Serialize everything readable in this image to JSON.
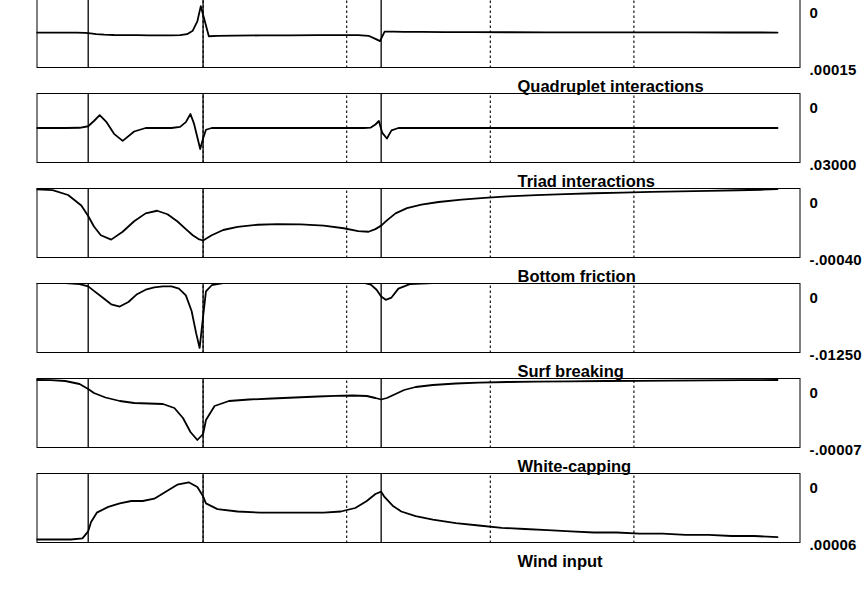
{
  "figure": {
    "source_tag": "WAVEC",
    "x_axis": {
      "title": "",
      "ticks": [
        0,
        250,
        500,
        750,
        1000,
        1250
      ],
      "range": [
        -40,
        1290
      ],
      "gridlines_dotted": [
        250,
        500,
        750,
        1000
      ]
    },
    "pole_markers": [
      {
        "label": "Pole 3",
        "x": 690
      },
      {
        "label": "Pole 2",
        "x": 1000
      },
      {
        "label": "Pole 1",
        "x": 1200
      }
    ],
    "depth_panel": {
      "title": "depth (m)",
      "yticks": [
        0,
        -5,
        -10,
        -15
      ],
      "ylim": [
        -16.5,
        1.5
      ],
      "grid_dotted_y": [
        -5,
        -10
      ]
    },
    "panels": [
      {
        "title": "Wind input",
        "top_label": ".00006",
        "bottom_label": "0",
        "ylim": [
          0,
          6e-05
        ],
        "sign": "positive"
      },
      {
        "title": "White-capping",
        "top_label": "-.00007",
        "bottom_label": "0",
        "ylim": [
          -7e-05,
          0
        ],
        "sign": "negative"
      },
      {
        "title": "Surf breaking",
        "top_label": "-.01250",
        "bottom_label": "0",
        "ylim": [
          -0.0125,
          0
        ],
        "sign": "negative"
      },
      {
        "title": "Bottom friction",
        "top_label": "-.00040",
        "bottom_label": "0",
        "ylim": [
          -0.0004,
          0
        ],
        "sign": "negative"
      },
      {
        "title": "Triad interactions",
        "top_label": ".03000",
        "bottom_label": "0",
        "ylim": [
          -0.03,
          0.03
        ],
        "sign": "signed"
      },
      {
        "title": "Quadruplet interactions",
        "top_label": ".00015",
        "bottom_label": "0",
        "ylim": [
          -0.00015,
          0.00015
        ],
        "sign": "signed"
      }
    ]
  },
  "chart_data": {
    "type": "line",
    "xlabel": "",
    "ylabel": "",
    "x_ticks": [
      0,
      250,
      500,
      750,
      1000,
      1250
    ],
    "xlim": [
      -40,
      1290
    ],
    "grid": true,
    "legend": "none",
    "annotations": [
      "Pole 1",
      "Pole 2",
      "Pole 3",
      "WAVEC"
    ],
    "series": [
      {
        "name": "Wind input",
        "ylim": [
          0,
          6e-05
        ],
        "ytick_labels": [
          ".00006",
          "0"
        ],
        "x": [
          0,
          40,
          80,
          120,
          160,
          200,
          240,
          280,
          320,
          360,
          400,
          440,
          480,
          520,
          560,
          600,
          630,
          655,
          670,
          685,
          690,
          700,
          715,
          735,
          760,
          790,
          820,
          860,
          900,
          940,
          975,
          995,
          1000,
          1010,
          1025,
          1045,
          1065,
          1085,
          1105,
          1125,
          1145,
          1165,
          1185,
          1195,
          1200,
          1210,
          1230,
          1260,
          1290
        ],
        "y": [
          5e-06,
          6e-06,
          6e-06,
          7e-06,
          7e-06,
          8e-06,
          8e-06,
          9e-06,
          9e-06,
          1e-05,
          1.1e-05,
          1.2e-05,
          1.3e-05,
          1.5e-05,
          1.7e-05,
          2e-05,
          2.3e-05,
          2.7e-05,
          3.2e-05,
          4e-05,
          4.4e-05,
          4.2e-05,
          3.6e-05,
          3e-05,
          2.7e-05,
          2.6e-05,
          2.6e-05,
          2.6e-05,
          2.6e-05,
          2.7e-05,
          2.9e-05,
          3.4e-05,
          4e-05,
          4.8e-05,
          5.2e-05,
          5e-05,
          4.4e-05,
          3.8e-05,
          3.6e-05,
          3.6e-05,
          3.4e-05,
          3.1e-05,
          2.6e-05,
          1.8e-05,
          1e-05,
          4e-06,
          3e-06,
          3e-06,
          3e-06
        ]
      },
      {
        "name": "White-capping",
        "ylim": [
          -7e-05,
          0
        ],
        "ytick_labels": [
          "-.00007",
          "0"
        ],
        "x": [
          0,
          60,
          120,
          180,
          240,
          300,
          360,
          420,
          470,
          520,
          560,
          600,
          630,
          650,
          665,
          680,
          690,
          700,
          715,
          740,
          770,
          800,
          840,
          880,
          920,
          955,
          980,
          995,
          1000,
          1010,
          1022,
          1035,
          1050,
          1070,
          1095,
          1120,
          1145,
          1170,
          1190,
          1200,
          1215,
          1240,
          1265,
          1290
        ],
        "y": [
          -2e-06,
          -2.2e-06,
          -2.4e-06,
          -2.6e-06,
          -2.8e-06,
          -3e-06,
          -3.3e-06,
          -3.6e-06,
          -4e-06,
          -4.6e-06,
          -5.5e-06,
          -7e-06,
          -9e-06,
          -1.2e-05,
          -1.6e-05,
          -2e-05,
          -2.15e-05,
          -2e-05,
          -1.8e-05,
          -1.75e-05,
          -1.78e-05,
          -1.85e-05,
          -1.95e-05,
          -2.05e-05,
          -2.15e-05,
          -2.3e-05,
          -2.8e-05,
          -4.2e-05,
          -5.6e-05,
          -6.2e-05,
          -5.4e-05,
          -4e-05,
          -3e-05,
          -2.6e-05,
          -2.55e-05,
          -2.5e-05,
          -2.3e-05,
          -1.95e-05,
          -1.5e-05,
          -1.1e-05,
          -6e-06,
          -3e-06,
          -2.2e-06,
          -2e-06
        ]
      },
      {
        "name": "Surf breaking",
        "ylim": [
          -0.0125,
          0
        ],
        "ytick_labels": [
          "-.01250",
          "0"
        ],
        "x": [
          0,
          100,
          200,
          300,
          400,
          480,
          550,
          600,
          640,
          660,
          672,
          682,
          690,
          698,
          708,
          720,
          740,
          780,
          830,
          880,
          930,
          965,
          985,
          995,
          1000,
          1006,
          1012,
          1020,
          1030,
          1042,
          1055,
          1070,
          1085,
          1100,
          1115,
          1130,
          1145,
          1160,
          1175,
          1190,
          1200,
          1215,
          1240,
          1270,
          1290
        ],
        "y": [
          0,
          0,
          0,
          0,
          0,
          0,
          0,
          0,
          -0.0002,
          -0.001,
          -0.0026,
          -0.003,
          -0.0024,
          -0.0012,
          -0.0003,
          0,
          0,
          0,
          0,
          0,
          0,
          0,
          -0.0004,
          -0.0015,
          -0.006,
          -0.0116,
          -0.009,
          -0.005,
          -0.0022,
          -0.001,
          -0.0006,
          -0.0006,
          -0.0008,
          -0.0012,
          -0.002,
          -0.0034,
          -0.0042,
          -0.0038,
          -0.0026,
          -0.0014,
          -0.0006,
          -0.0002,
          0,
          0,
          0
        ]
      },
      {
        "name": "Bottom friction",
        "ylim": [
          -0.0004,
          0
        ],
        "ytick_labels": [
          "-.00040",
          "0"
        ],
        "x": [
          0,
          30,
          70,
          120,
          170,
          220,
          270,
          320,
          370,
          420,
          470,
          510,
          550,
          590,
          620,
          645,
          665,
          680,
          690,
          700,
          712,
          730,
          755,
          790,
          830,
          870,
          905,
          940,
          965,
          985,
          995,
          1000,
          1008,
          1018,
          1030,
          1045,
          1062,
          1080,
          1100,
          1120,
          1140,
          1160,
          1178,
          1190,
          1200,
          1212,
          1235,
          1262,
          1290
        ],
        "y": [
          -6e-06,
          -1e-05,
          -1.3e-05,
          -1.6e-05,
          -1.9e-05,
          -2.2e-05,
          -2.6e-05,
          -3e-05,
          -3.5e-05,
          -4.1e-05,
          -4.8e-05,
          -5.6e-05,
          -6.6e-05,
          -8e-05,
          -9.5e-05,
          -0.000115,
          -0.000145,
          -0.000185,
          -0.000215,
          -0.000235,
          -0.00025,
          -0.000246,
          -0.00023,
          -0.000215,
          -0.000208,
          -0.000206,
          -0.00021,
          -0.000222,
          -0.00024,
          -0.00027,
          -0.00029,
          -0.0003,
          -0.000292,
          -0.00027,
          -0.000235,
          -0.00019,
          -0.00015,
          -0.00013,
          -0.000145,
          -0.00019,
          -0.00025,
          -0.000295,
          -0.00027,
          -0.00022,
          -0.00016,
          -0.0001,
          -4e-05,
          -1.2e-05,
          -8e-06
        ]
      },
      {
        "name": "Triad interactions",
        "ylim": [
          -0.03,
          0.03
        ],
        "ytick_labels": [
          ".03000",
          "0"
        ],
        "x": [
          0,
          150,
          300,
          450,
          550,
          620,
          660,
          672,
          680,
          688,
          694,
          700,
          708,
          720,
          760,
          820,
          880,
          930,
          965,
          985,
          995,
          1000,
          1005,
          1010,
          1016,
          1022,
          1030,
          1040,
          1055,
          1075,
          1100,
          1120,
          1140,
          1155,
          1168,
          1180,
          1190,
          1200,
          1215,
          1240,
          1270,
          1290
        ],
        "y": [
          0,
          0,
          0,
          0,
          0,
          0,
          0,
          -0.002,
          -0.009,
          -0.0042,
          0.006,
          0.003,
          0.0004,
          0,
          0,
          0,
          0,
          0,
          0,
          0,
          -0.0015,
          -0.009,
          -0.018,
          -0.008,
          0.004,
          0.012,
          0.005,
          0.001,
          0,
          0,
          0,
          -0.003,
          -0.011,
          -0.005,
          0.005,
          0.011,
          0.006,
          0.0015,
          0.0002,
          0,
          0,
          0
        ]
      },
      {
        "name": "Quadruplet interactions",
        "ylim": [
          -0.00015,
          0.00015
        ],
        "ytick_labels": [
          ".00015",
          "0"
        ],
        "x": [
          0,
          80,
          160,
          240,
          320,
          400,
          470,
          530,
          580,
          620,
          650,
          670,
          684,
          692,
          700,
          712,
          730,
          760,
          800,
          850,
          900,
          945,
          975,
          990,
          998,
          1004,
          1010,
          1018,
          1028,
          1040,
          1055,
          1075,
          1095,
          1115,
          1135,
          1155,
          1172,
          1186,
          1196,
          1205,
          1220,
          1248,
          1275,
          1290
        ],
        "y": [
          2e-06,
          2.2e-06,
          2.4e-06,
          2.6e-06,
          2.8e-06,
          3e-06,
          3.3e-06,
          3.6e-06,
          4e-06,
          4.5e-06,
          5e-06,
          5.5e-06,
          5.8e-06,
          -3.5e-05,
          -2.5e-05,
          -1.2e-05,
          -9e-06,
          -9e-06,
          -9.5e-06,
          -1e-05,
          -1.05e-05,
          -1.1e-05,
          -1.2e-05,
          -1.4e-05,
          6e-05,
          0.000115,
          5e-05,
          1e-05,
          -5e-06,
          -9e-06,
          -1e-05,
          -1e-05,
          -9.8e-06,
          -9.5e-06,
          -9e-06,
          -8.5e-06,
          -7e-06,
          -4.5e-06,
          -2e-06,
          5e-07,
          1.5e-06,
          2e-06,
          2e-06,
          2e-06
        ]
      },
      {
        "name": "depth (m)",
        "ylim": [
          -16.5,
          1.5
        ],
        "ytick_labels": [
          "0",
          "-5",
          "-10",
          "-15"
        ],
        "x": [
          0,
          20,
          45,
          70,
          95,
          120,
          150,
          180,
          210,
          240,
          270,
          300,
          330,
          360,
          390,
          420,
          450,
          480,
          510,
          540,
          570,
          600,
          630,
          655,
          675,
          690,
          705,
          720,
          740,
          765,
          790,
          820,
          850,
          880,
          910,
          940,
          965,
          985,
          1000,
          1015,
          1035,
          1055,
          1075,
          1095,
          1115,
          1135,
          1155,
          1175,
          1190,
          1200,
          1215,
          1240,
          1265,
          1290
        ],
        "y": [
          -0.4,
          -8.6,
          -12.4,
          -12.6,
          -12.5,
          -12.3,
          -12.1,
          -11.9,
          -11.6,
          -11.2,
          -10.9,
          -10.6,
          -10.3,
          -10.0,
          -9.6,
          -9.2,
          -8.9,
          -8.6,
          -8.3,
          -8.0,
          -7.7,
          -7.4,
          -7.0,
          -6.6,
          -6.2,
          -5.9,
          -5.8,
          -5.9,
          -6.1,
          -6.2,
          -6.2,
          -6.1,
          -6.0,
          -5.9,
          -5.8,
          -5.6,
          -5.4,
          -5.2,
          -5.0,
          -4.6,
          -4.1,
          -3.8,
          -3.9,
          -4.2,
          -4.1,
          -3.6,
          -3.0,
          -2.4,
          -2.1,
          -2.0,
          -2.0,
          -2.0,
          -2.0,
          -2.0
        ]
      }
    ]
  }
}
